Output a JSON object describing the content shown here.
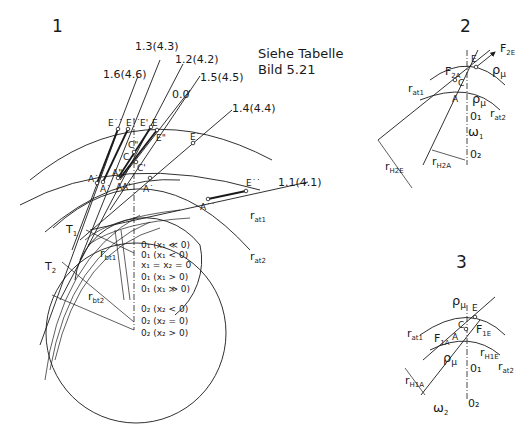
{
  "figures": {
    "fig1": {
      "number": "1",
      "note_line1": "Siehe Tabelle",
      "note_line2": "Bild 5.21",
      "line_labels": [
        "1.3(4.3)",
        "1.2(4.2)",
        "1.6(4.6)",
        "1.5(4.5)",
        "0.0",
        "1.4(4.4)",
        "1.1(4.1)"
      ],
      "points_E": [
        "E˙˙",
        "E˙˙",
        "E'",
        "E",
        "E\"",
        "E˙",
        "E˙˙"
      ],
      "points_C": [
        "C\"",
        "C",
        "C'"
      ],
      "points_A": [
        "A˙˙",
        "A˙",
        "A\"",
        "A",
        "A'",
        "A˙",
        "A˙˙"
      ],
      "tangent_points": [
        "T",
        "T"
      ],
      "tangent_subs": [
        "1",
        "2"
      ],
      "radii": {
        "rbt1": "r",
        "rbt1_sub": "bt1",
        "rbt2": "r",
        "rbt2_sub": "bt2",
        "rat1": "r",
        "rat1_sub": "at1",
        "rat2": "r",
        "rat2_sub": "at2"
      },
      "centers": [
        "0₁ (x₁ ≪ 0)",
        "0₁ (x₁ < 0)",
        "x₁ = x₂ = 0",
        "0₁ (x₁ > 0)",
        "0₁ (x₁ ≫ 0)",
        "0₂ (x₂ < 0)",
        "0₂ (x₂ = 0)",
        "0₂ (x₂ > 0)"
      ]
    },
    "fig2": {
      "number": "2",
      "F2E": "F",
      "F2E_sub": "2E",
      "F2A": "F",
      "F2A_sub": "2A",
      "rho": "ρ",
      "rho_sub": "μ",
      "E": "E",
      "C": "C",
      "A": "A",
      "rat1": "r",
      "rat1_sub": "at1",
      "rat2": "r",
      "rat2_sub": "at2",
      "O1": "0₁",
      "O2": "0₂",
      "omega": "ω",
      "omega_sub": "1",
      "rH2E": "r",
      "rH2E_sub": "H2E",
      "rH2A": "r",
      "rH2A_sub": "H2A"
    },
    "fig3": {
      "number": "3",
      "rho": "ρ",
      "rho_sub": "μ",
      "E": "E",
      "C": "C",
      "A": "A",
      "F1E": "F",
      "F1E_sub": "1E",
      "F1A": "F",
      "F1A_sub": "1A",
      "rat1": "r",
      "rat1_sub": "at1",
      "rat2": "r",
      "rat2_sub": "at2",
      "rH1E": "r",
      "rH1E_sub": "H1E",
      "rH1A": "r",
      "rH1A_sub": "H1A",
      "O1": "0₁",
      "O2": "0₂",
      "omega": "ω",
      "omega_sub": "2"
    }
  }
}
